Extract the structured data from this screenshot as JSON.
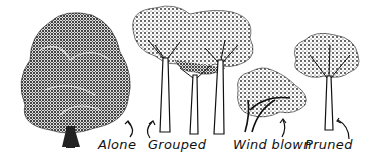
{
  "figure": {
    "trees": [
      {
        "id": "alone",
        "label": "Alone"
      },
      {
        "id": "grouped",
        "label": "Grouped"
      },
      {
        "id": "wind-blown",
        "label": "Wind blown"
      },
      {
        "id": "pruned",
        "label": "Pruned"
      }
    ],
    "colors": {
      "ink": "#111111",
      "background": "#ffffff"
    }
  }
}
